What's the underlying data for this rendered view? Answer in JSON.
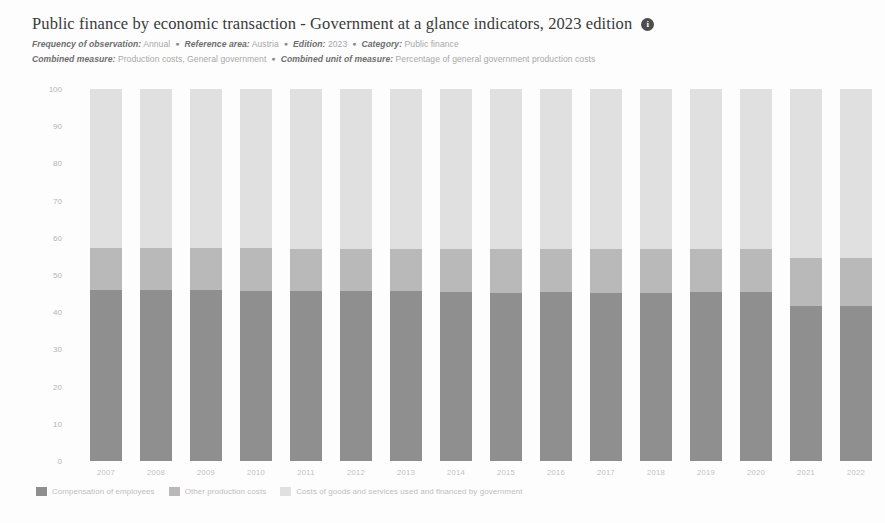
{
  "header": {
    "title": "Public finance by economic transaction - Government at a glance indicators, 2023 edition",
    "info_icon": "i",
    "meta": [
      [
        {
          "key": "Frequency of observation",
          "value": "Annual"
        },
        {
          "key": "Reference area",
          "value": "Austria"
        },
        {
          "key": "Edition",
          "value": "2023"
        },
        {
          "key": "Category",
          "value": "Public finance"
        }
      ],
      [
        {
          "key": "Combined measure",
          "value": "Production costs, General government"
        },
        {
          "key": "Combined unit of measure",
          "value": "Percentage of general government production costs"
        }
      ]
    ],
    "separator": "●"
  },
  "chart_data": {
    "type": "bar",
    "stacked": true,
    "stack_mode": "percent",
    "title": "Public finance by economic transaction - Government at a glance indicators, 2023 edition",
    "xlabel": "",
    "ylabel": "",
    "ylim": [
      0,
      100
    ],
    "yticks": [
      0,
      10,
      20,
      30,
      40,
      50,
      60,
      70,
      80,
      90,
      100
    ],
    "grid": false,
    "legend_position": "bottom",
    "categories": [
      "2007",
      "2008",
      "2009",
      "2010",
      "2011",
      "2012",
      "2013",
      "2014",
      "2015",
      "2016",
      "2017",
      "2018",
      "2019",
      "2020",
      "2021",
      "2022"
    ],
    "series": [
      {
        "name": "Compensation of employees",
        "color": "#8f8f8f",
        "values": [
          46.0,
          45.9,
          46.1,
          45.8,
          45.6,
          45.6,
          45.6,
          45.5,
          45.2,
          45.3,
          45.2,
          45.1,
          45.3,
          45.4,
          41.7,
          41.6
        ]
      },
      {
        "name": "Other production costs",
        "color": "#b9b9b9",
        "values": [
          11.2,
          11.3,
          11.2,
          11.4,
          11.5,
          11.5,
          11.4,
          11.5,
          11.7,
          11.6,
          11.7,
          11.8,
          11.6,
          11.5,
          12.9,
          13.0
        ]
      },
      {
        "name": "Costs of goods and services used and financed by government",
        "color": "#e0e0e0",
        "values": [
          42.8,
          42.8,
          42.7,
          42.8,
          42.9,
          42.9,
          43.0,
          43.0,
          43.1,
          43.1,
          43.1,
          43.1,
          43.1,
          43.1,
          45.4,
          45.4
        ]
      }
    ]
  }
}
